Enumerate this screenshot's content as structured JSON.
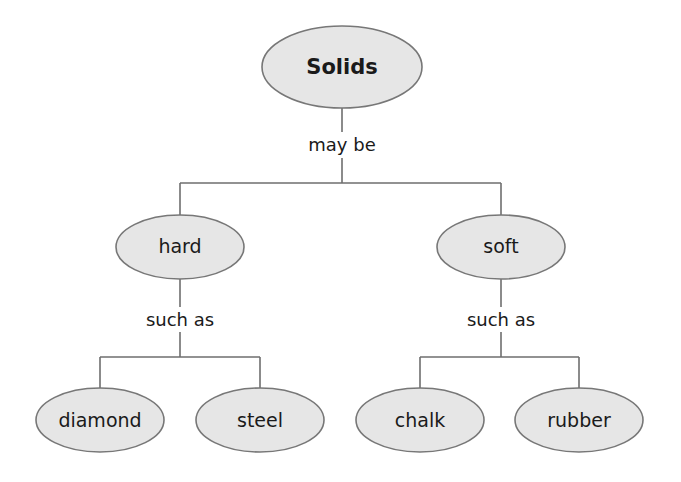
{
  "diagram": {
    "type": "concept-map",
    "root": {
      "label": "Solids"
    },
    "root_link": "may be",
    "branches": [
      {
        "label": "hard",
        "link": "such as",
        "children": [
          "diamond",
          "steel"
        ]
      },
      {
        "label": "soft",
        "link": "such as",
        "children": [
          "chalk",
          "rubber"
        ]
      }
    ]
  },
  "colors": {
    "node_fill": "#e6e6e6",
    "node_stroke": "#777777",
    "line": "#6e6e6e",
    "text": "#1a1a1a"
  }
}
